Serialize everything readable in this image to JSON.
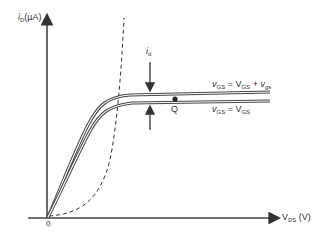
{
  "axes": {
    "y_label": {
      "var": "i",
      "sub": "D",
      "unit": "(µA)"
    },
    "x_label": {
      "var": "V",
      "sub": "DS",
      "unit": " (V)"
    },
    "origin": "0"
  },
  "curves": [
    {
      "label": {
        "lhs": "v",
        "lhs_sub": "GS",
        "eq": " = ",
        "rhs": "V",
        "rhs_sub": "GS",
        "plus": " + ",
        "extra": "v",
        "extra_sub": "gs"
      }
    },
    {
      "label": {
        "lhs": "v",
        "lhs_sub": "GS",
        "eq": " = ",
        "rhs": "V",
        "rhs_sub": "GS"
      }
    }
  ],
  "annotations": {
    "id": {
      "var": "i",
      "sub": "d"
    },
    "q_point": "Q"
  },
  "colors": {
    "line": "#333333",
    "background": "#ffffff"
  }
}
